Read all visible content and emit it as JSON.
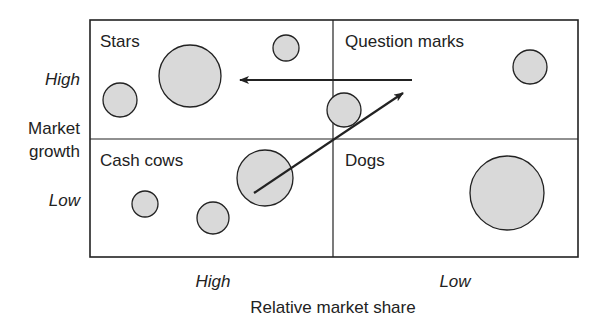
{
  "diagram": {
    "quadrants": {
      "top_left": "Stars",
      "top_right": "Question marks",
      "bottom_left": "Cash cows",
      "bottom_right": "Dogs"
    },
    "y_axis": {
      "label_line1": "Market",
      "label_line2": "growth",
      "tick_high": "High",
      "tick_low": "Low"
    },
    "x_axis": {
      "label": "Relative market share",
      "tick_high": "High",
      "tick_low": "Low"
    },
    "colors": {
      "bubble_fill": "#d9d9d9",
      "stroke": "#222222",
      "background": "#ffffff"
    },
    "bubbles": [
      {
        "quadrant": "Stars",
        "cx": 120,
        "cy": 100,
        "r": 17
      },
      {
        "quadrant": "Stars",
        "cx": 190,
        "cy": 76,
        "r": 31
      },
      {
        "quadrant": "Stars",
        "cx": 286,
        "cy": 48,
        "r": 13
      },
      {
        "quadrant": "Question marks",
        "cx": 530,
        "cy": 67,
        "r": 17
      },
      {
        "quadrant": "Stars/Question marks boundary",
        "cx": 344,
        "cy": 110,
        "r": 17
      },
      {
        "quadrant": "Cash cows",
        "cx": 145,
        "cy": 204,
        "r": 13
      },
      {
        "quadrant": "Cash cows",
        "cx": 213,
        "cy": 218,
        "r": 16
      },
      {
        "quadrant": "Cash cows",
        "cx": 265,
        "cy": 178,
        "r": 28
      },
      {
        "quadrant": "Dogs",
        "cx": 507,
        "cy": 193,
        "r": 37
      }
    ],
    "arrows": [
      {
        "name": "question-marks-to-stars",
        "x1": 412,
        "y1": 80,
        "x2": 240,
        "y2": 80
      },
      {
        "name": "cash-cows-to-question-marks",
        "x1": 254,
        "y1": 193,
        "x2": 403,
        "y2": 93
      }
    ]
  }
}
